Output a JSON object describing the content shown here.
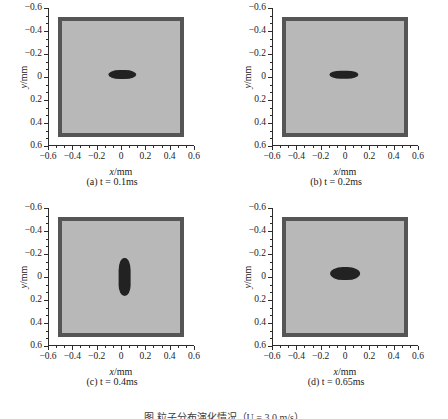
{
  "figure": {
    "caption": "图            粒子分布演化情况（U = 3.0 m/s）"
  },
  "axes": {
    "xlabel_sym": "x",
    "xlabel_unit": "/mm",
    "ylabel_sym": "y",
    "ylabel_unit": "/mm",
    "xticks": [
      "−0.6",
      "−0.4",
      "−0.2",
      "0",
      "0.2",
      "0.4",
      "0.6"
    ],
    "yticks": [
      "0.6",
      "0.4",
      "0.2",
      "0",
      "−0.2",
      "−0.4",
      "−0.6"
    ]
  },
  "chart_data": {
    "type": "scatter",
    "title": "",
    "xlabel": "x/mm",
    "ylabel": "y/mm",
    "xlim": [
      -0.6,
      0.6
    ],
    "ylim": [
      -0.6,
      0.6
    ],
    "xtick_values": [
      -0.6,
      -0.4,
      -0.2,
      0,
      0.2,
      0.4,
      0.6
    ],
    "ytick_values": [
      -0.6,
      -0.4,
      -0.2,
      0,
      0.2,
      0.4,
      0.6
    ],
    "minor_ticks_per_interval": 2,
    "grid": false,
    "legend": "none",
    "domain_box": {
      "x_range": [
        -0.52,
        0.52
      ],
      "y_range": [
        -0.52,
        0.52
      ],
      "border_color": "#555555",
      "fill_color": "#b8b8b8",
      "border_thickness_mm": 0.04
    },
    "particle_color": "#222222",
    "panels": [
      {
        "id": "a",
        "label": "(a)",
        "time_symbol": "t",
        "time_value": "0.1ms",
        "caption": "(a)  t = 0.1ms",
        "cluster": {
          "shape": "horizontal-blob",
          "center_x": 0.01,
          "center_y": 0.02,
          "width_mm": 0.225,
          "height_mm": 0.085
        }
      },
      {
        "id": "b",
        "label": "(b)",
        "time_symbol": "t",
        "time_value": "0.2ms",
        "caption": "(b)  t = 0.2ms",
        "cluster": {
          "shape": "pinched-horizontal-blob",
          "center_x": -0.01,
          "center_y": 0.02,
          "width_mm": 0.24,
          "height_mm": 0.075
        }
      },
      {
        "id": "c",
        "label": "(c)",
        "time_symbol": "t",
        "time_value": "0.4ms",
        "caption": "(c)  t = 0.4ms",
        "cluster": {
          "shape": "vertical-blob",
          "center_x": 0.03,
          "center_y": 0.0,
          "width_mm": 0.105,
          "height_mm": 0.33
        }
      },
      {
        "id": "d",
        "label": "(d)",
        "time_symbol": "t",
        "time_value": "0.65ms",
        "caption": "(d)  t = 0.65ms",
        "cluster": {
          "shape": "thick-horizontal-blob",
          "center_x": 0.0,
          "center_y": 0.03,
          "width_mm": 0.245,
          "height_mm": 0.12
        }
      }
    ]
  }
}
